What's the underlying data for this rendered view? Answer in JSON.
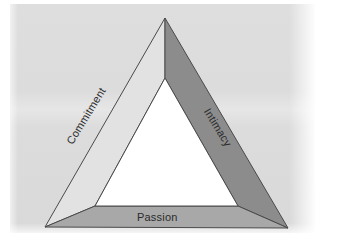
{
  "figure": {
    "background_color": "#dcdcdc",
    "page_color": "#ffffff",
    "outline_color": "#3a3a3a",
    "components": [
      {
        "id": "commitment",
        "label": "Commitment",
        "position": "left-side",
        "fill_color": "#e2e2e2",
        "rotation_deg": -58.5
      },
      {
        "id": "intimacy",
        "label": "Intimacy",
        "position": "right-side",
        "fill_color": "#8c8c8c",
        "rotation_deg": 58.5
      },
      {
        "id": "passion",
        "label": "Passion",
        "position": "bottom-side",
        "fill_color": "#a8a8a8",
        "rotation_deg": 0
      }
    ],
    "geometry": {
      "outer_apex": "165,18",
      "outer_bottom_left": "45,227",
      "outer_bottom_right": "288,228",
      "inner_apex": "165,78",
      "inner_bottom_left": "95,206",
      "inner_bottom_right": "238,206"
    }
  }
}
